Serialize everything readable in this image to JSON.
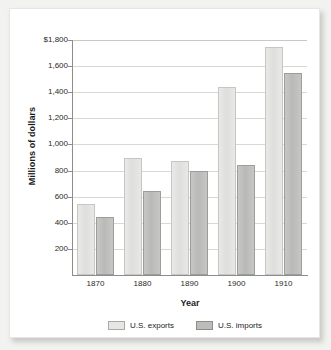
{
  "chart_data": {
    "type": "bar",
    "title": "",
    "xlabel": "Year",
    "ylabel": "Millions of dollars",
    "categories": [
      "1870",
      "1880",
      "1890",
      "1900",
      "1910"
    ],
    "series": [
      {
        "name": "U.S. exports",
        "color": "#e3e3e1",
        "values": [
          545,
          895,
          870,
          1440,
          1745
        ]
      },
      {
        "name": "U.S. imports",
        "color": "#bdbdbb",
        "values": [
          445,
          645,
          795,
          845,
          1545
        ]
      }
    ],
    "ylim": [
      0,
      1800
    ],
    "yticks": [
      200,
      400,
      600,
      800,
      1000,
      1200,
      1400,
      1600,
      1800
    ],
    "ytick_labels": [
      "200",
      "400",
      "600",
      "800",
      "1,000",
      "1,200",
      "1,400",
      "1,600",
      "$1,800"
    ],
    "grid": true,
    "legend_position": "bottom"
  },
  "legend": {
    "entries": [
      {
        "label": "U.S. exports"
      },
      {
        "label": "U.S. imports"
      }
    ]
  }
}
